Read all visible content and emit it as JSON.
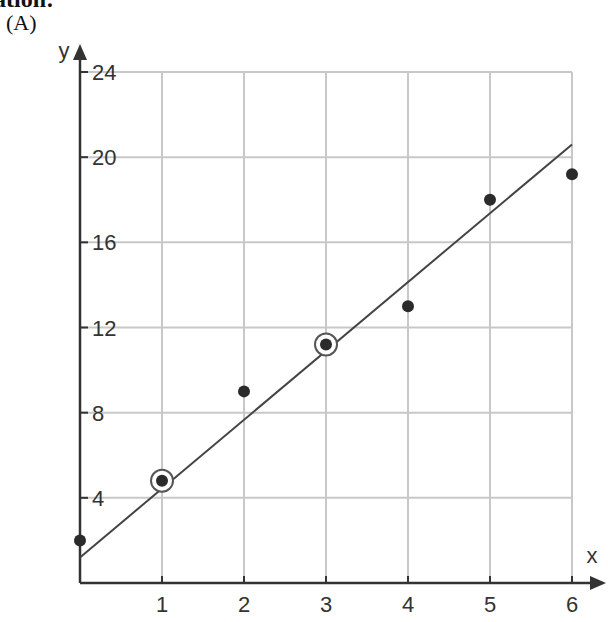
{
  "heading": "ation:",
  "part_label": "(A)",
  "chart_data": {
    "type": "scatter",
    "title": "",
    "xlabel": "x",
    "ylabel": "y",
    "xlim": [
      0,
      6
    ],
    "ylim": [
      0,
      24
    ],
    "x_ticks": [
      1,
      2,
      3,
      4,
      5,
      6
    ],
    "y_ticks": [
      4,
      8,
      12,
      16,
      20,
      24
    ],
    "grid": true,
    "legend": null,
    "series": [
      {
        "name": "data points",
        "x": [
          0,
          1,
          2,
          3,
          4,
          5,
          6
        ],
        "y": [
          2,
          4.8,
          9,
          11.2,
          13,
          18,
          19.2
        ]
      }
    ],
    "highlighted_points": [
      {
        "x": 1,
        "y": 4.8
      },
      {
        "x": 3,
        "y": 11.2
      }
    ],
    "fit_line": {
      "x0": 0,
      "y0": 1.2,
      "x1": 6,
      "y1": 20.6
    }
  },
  "colors": {
    "axis": "#333333",
    "grid": "#c8c8c8",
    "points": "#2b2b2b",
    "line": "#444444"
  }
}
